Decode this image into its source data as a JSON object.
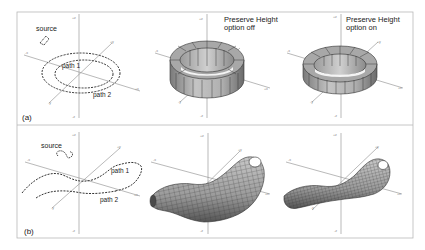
{
  "figure": {
    "panel_a": {
      "label": "(a)",
      "source_label": "source",
      "path1_label": "path 1",
      "path2_label": "path 2",
      "middle_caption_line1": "Preserve Height",
      "middle_caption_line2": "option off",
      "right_caption_line1": "Preserve Height",
      "right_caption_line2": "option on"
    },
    "panel_b": {
      "label": "(b)",
      "source_label": "source",
      "path1_label": "path 1",
      "path2_label": "path 2"
    },
    "axes": {
      "plus_z": "+z",
      "minus_z": "-z",
      "plus_x": "+x",
      "minus_x": "-x",
      "plus_y": "+y",
      "minus_y": "-y"
    },
    "colors": {
      "frame": "#b8b8b8",
      "axis": "#8a8a8a",
      "path": "#333333",
      "surface_light": "#bdbdbd",
      "surface_dark": "#6e6e6e",
      "surface_top": "#a9a9a9"
    }
  }
}
